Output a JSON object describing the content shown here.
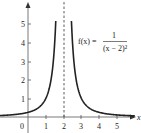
{
  "chart_data": {
    "type": "line",
    "title": "",
    "function_label": "f(x) =",
    "formula_numerator": "1",
    "formula_denominator": "(x − 2)²",
    "xlabel": "x",
    "ylabel": "",
    "xlim": [
      -1.6,
      6.2
    ],
    "ylim": [
      -0.6,
      6.3
    ],
    "x_ticks": [
      1,
      2,
      3,
      4,
      5
    ],
    "x_tick_labels": [
      "1",
      "2",
      "3",
      "4",
      "5"
    ],
    "y_ticks": [
      1,
      2,
      3,
      4,
      5
    ],
    "y_tick_labels": [
      "1",
      "2",
      "3",
      "4",
      "5"
    ],
    "origin_label": "0",
    "asymptote": {
      "x": 2,
      "style": "dashed"
    },
    "grid": false,
    "series": [
      {
        "name": "f(x) = 1/(x-2)^2",
        "x": [
          -1.5,
          -1,
          -0.5,
          0,
          0.5,
          1,
          1.25,
          1.5,
          1.6,
          2.4,
          2.5,
          2.75,
          3,
          3.5,
          4,
          5,
          5.8
        ],
        "y": [
          0.08,
          0.11,
          0.16,
          0.25,
          0.44,
          1,
          1.78,
          4,
          6.25,
          6.25,
          4,
          1.78,
          1,
          0.44,
          0.25,
          0.11,
          0.07
        ]
      }
    ]
  }
}
